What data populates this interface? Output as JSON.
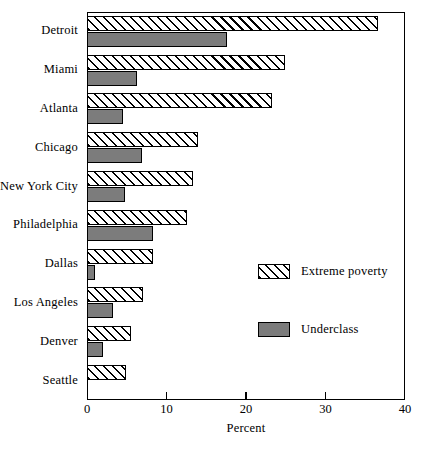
{
  "chart_data": {
    "type": "bar",
    "orientation": "horizontal",
    "title": "",
    "xlabel": "Percent",
    "ylabel": "",
    "xlim": [
      0,
      40
    ],
    "xticks": [
      0,
      10,
      20,
      30,
      40
    ],
    "xtick_labels": [
      "0",
      "10",
      "20",
      "30",
      "40"
    ],
    "grid": false,
    "legend_position": "inside-right",
    "categories": [
      "Detroit",
      "Miami",
      "Atlanta",
      "Chicago",
      "New York City",
      "Philadelphia",
      "Dallas",
      "Los Angeles",
      "Denver",
      "Seattle"
    ],
    "series": [
      {
        "name": "Extreme poverty",
        "fill": "diagonal-hatch",
        "values": [
          36.6,
          24.9,
          23.3,
          14.0,
          13.3,
          12.6,
          8.3,
          7.0,
          5.5,
          4.9
        ]
      },
      {
        "name": "Underclass",
        "fill": "solid-gray",
        "values": [
          17.6,
          6.3,
          4.5,
          6.9,
          4.8,
          8.3,
          1.0,
          3.3,
          2.0,
          0.0
        ]
      }
    ]
  },
  "legend": {
    "items": [
      {
        "label": "Extreme poverty",
        "swatch": "hatch"
      },
      {
        "label": "Underclass",
        "swatch": "solid"
      }
    ]
  },
  "colors": {
    "underclass_fill": "#7c7c7c",
    "extreme_poverty_fill": "#ffffff",
    "axis": "#000000",
    "background": "#ffffff"
  }
}
